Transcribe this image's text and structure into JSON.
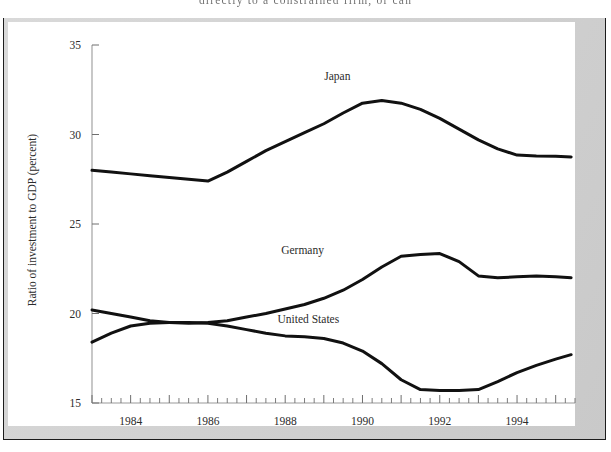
{
  "page": {
    "bleed_text": "directly to a constrained firm, or can"
  },
  "figure": {
    "panel_background": "#ffffff",
    "mat_color": "#d4d4d4",
    "frame_color": "#1c1c1c"
  },
  "chart_data": {
    "type": "line",
    "title": "",
    "xlabel": "",
    "ylabel": "Ratio of investment to GDP (percent)",
    "ylim": [
      15,
      35
    ],
    "xlim": [
      1983.0,
      1995.5
    ],
    "ytick_values": [
      15,
      20,
      25,
      30,
      35
    ],
    "ytick_labels": [
      "15",
      "20",
      "25",
      "30",
      "35"
    ],
    "xtick_labels": [
      "1984",
      "1986",
      "1988",
      "1990",
      "1992",
      "1994"
    ],
    "xtick_values": [
      1984,
      1986,
      1988,
      1990,
      1992,
      1994
    ],
    "minor_tick_interval": 0.25,
    "grid": false,
    "legend": "inline-annotations",
    "line_color": "#111111",
    "x": [
      1983.0,
      1983.5,
      1984.0,
      1984.5,
      1985.0,
      1985.5,
      1986.0,
      1986.5,
      1987.0,
      1987.5,
      1988.0,
      1988.5,
      1989.0,
      1989.5,
      1990.0,
      1990.5,
      1991.0,
      1991.5,
      1992.0,
      1992.5,
      1993.0,
      1993.5,
      1994.0,
      1994.5,
      1995.0,
      1995.4
    ],
    "series": [
      {
        "name": "Japan",
        "label": "Japan",
        "label_x": 1989.35,
        "label_y": 33.05,
        "values": [
          28.0,
          27.9,
          27.8,
          27.7,
          27.6,
          27.5,
          27.4,
          27.9,
          28.5,
          29.1,
          29.6,
          30.1,
          30.6,
          31.2,
          31.75,
          31.9,
          31.75,
          31.4,
          30.9,
          30.3,
          29.7,
          29.2,
          28.85,
          28.8,
          28.78,
          28.75
        ]
      },
      {
        "name": "Germany",
        "label": "Germany",
        "label_x": 1988.45,
        "label_y": 23.35,
        "values": [
          20.2,
          20.0,
          19.8,
          19.6,
          19.5,
          19.45,
          19.5,
          19.6,
          19.8,
          20.0,
          20.25,
          20.5,
          20.85,
          21.3,
          21.9,
          22.6,
          23.2,
          23.3,
          23.35,
          22.9,
          22.1,
          22.0,
          22.05,
          22.1,
          22.05,
          22.0
        ]
      },
      {
        "name": "United States",
        "label": "United States",
        "label_x": 1988.6,
        "label_y": 19.45,
        "values": [
          18.4,
          18.9,
          19.3,
          19.45,
          19.5,
          19.5,
          19.45,
          19.3,
          19.1,
          18.9,
          18.75,
          18.7,
          18.6,
          18.35,
          17.9,
          17.2,
          16.3,
          15.75,
          15.7,
          15.7,
          15.75,
          16.2,
          16.7,
          17.1,
          17.45,
          17.7
        ]
      }
    ]
  }
}
